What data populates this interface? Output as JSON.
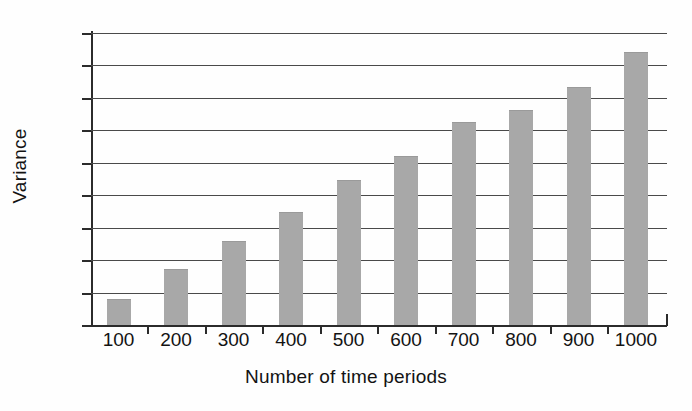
{
  "chart_data": {
    "type": "bar",
    "title": "",
    "xlabel": "Number of time periods",
    "ylabel": "Variance",
    "categories": [
      "100",
      "200",
      "300",
      "400",
      "500",
      "600",
      "700",
      "800",
      "900",
      "1000"
    ],
    "values": [
      7.7,
      17.0,
      25.6,
      34.6,
      44.4,
      51.9,
      62.4,
      66.0,
      73.1,
      83.9
    ],
    "ylim": [
      0,
      90
    ],
    "ytick_labels": [
      "0",
      "10",
      "20",
      "30",
      "40",
      "50",
      "60",
      "70",
      "80",
      "90"
    ],
    "ytick_values": [
      0,
      10,
      20,
      30,
      40,
      50,
      60,
      70,
      80,
      90
    ],
    "grid": "horizontal",
    "legend": "none",
    "bar_color": "#a8a8a8",
    "axis_color": "#2b2b2b",
    "gridline_color": "#4a4a4a"
  }
}
